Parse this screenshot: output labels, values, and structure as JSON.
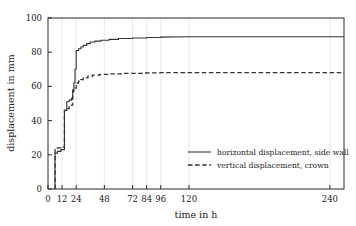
{
  "chart_data": {
    "type": "line",
    "title": "",
    "xlabel": "time in h",
    "ylabel": "displacement in mm",
    "xlim": [
      0,
      252
    ],
    "ylim": [
      0,
      100
    ],
    "xticks": [
      0,
      12,
      24,
      48,
      72,
      84,
      96,
      120,
      240
    ],
    "xtick_labels": [
      "0",
      "12",
      "24",
      "48",
      "72",
      "84",
      "96",
      "120",
      "240"
    ],
    "yticks": [
      0,
      20,
      40,
      60,
      80,
      100
    ],
    "ytick_labels": [
      "0",
      "20",
      "40",
      "60",
      "80",
      "100"
    ],
    "grid": "vertical-only",
    "legend_position": "lower-right-inside",
    "series": [
      {
        "name": "horizontal displacement, side wall",
        "style": "solid",
        "color": "#333333",
        "final_value": 89,
        "x": [
          6,
          6,
          8,
          8,
          11,
          11,
          14,
          14,
          16,
          16,
          18,
          18,
          20,
          20,
          21,
          21,
          22,
          22,
          23,
          23,
          24,
          24,
          26,
          26,
          28,
          28,
          30,
          30,
          33,
          33,
          36,
          36,
          40,
          40,
          45,
          45,
          52,
          52,
          60,
          60,
          72,
          72,
          84,
          84,
          96,
          96,
          120,
          252
        ],
        "y": [
          0,
          21,
          21,
          22,
          22,
          23,
          23,
          46,
          46,
          51,
          51,
          52,
          52,
          53,
          53,
          58,
          58,
          62,
          62,
          70,
          70,
          81,
          81,
          82,
          82,
          83,
          83,
          84,
          84,
          85,
          85,
          86,
          86,
          86.5,
          86.5,
          87,
          87,
          87.5,
          87.5,
          88,
          88,
          88.3,
          88.3,
          88.6,
          88.6,
          88.8,
          89,
          89
        ]
      },
      {
        "name": "vertical displacement, crown",
        "style": "dashed",
        "color": "#333333",
        "final_value": 68,
        "x": [
          6,
          6,
          8,
          8,
          11,
          11,
          14,
          14,
          16,
          16,
          18,
          18,
          20,
          20,
          21,
          21,
          22,
          22,
          23,
          23,
          24,
          24,
          26,
          26,
          28,
          28,
          30,
          30,
          34,
          34,
          38,
          38,
          44,
          44,
          52,
          52,
          64,
          64,
          80,
          80,
          96,
          120,
          252
        ],
        "y": [
          0,
          23,
          23,
          24,
          24,
          24.5,
          24.5,
          46,
          46,
          47,
          47,
          48,
          48,
          49,
          49,
          57,
          57,
          58,
          58,
          59,
          59,
          62,
          62,
          63,
          63,
          64,
          64,
          65,
          65,
          66,
          66,
          66.6,
          66.6,
          67,
          67,
          67.3,
          67.3,
          67.6,
          67.6,
          67.8,
          68,
          68,
          68
        ]
      }
    ]
  },
  "legend": {
    "items": [
      {
        "label": "horizontal displacement, side wall",
        "style": "solid"
      },
      {
        "label": "vertical displacement, crown",
        "style": "dashed"
      }
    ]
  }
}
